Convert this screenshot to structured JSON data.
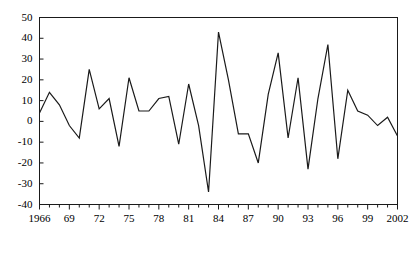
{
  "chart_data": {
    "type": "line",
    "title": "",
    "subtitle": "",
    "xlabel": "",
    "ylabel": "",
    "xlim": [
      1966,
      2002
    ],
    "ylim": [
      -40,
      50
    ],
    "ytick_values": [
      50,
      40,
      30,
      20,
      10,
      0,
      -10,
      -20,
      -30,
      -40
    ],
    "ytick_labels": [
      "50",
      "40",
      "30",
      "20",
      "10",
      "0",
      "-10",
      "-20",
      "-30",
      "-40"
    ],
    "xtick_values": [
      1966,
      1969,
      1972,
      1975,
      1978,
      1981,
      1984,
      1987,
      1990,
      1993,
      1996,
      1999,
      2002
    ],
    "xtick_labels": [
      "1966",
      "69",
      "72",
      "75",
      "78",
      "81",
      "84",
      "87",
      "90",
      "93",
      "96",
      "99",
      "2002"
    ],
    "x_minor_tick_interval": 1,
    "grid": false,
    "legend": false,
    "legend_position": "none",
    "series": [
      {
        "name": "series-1",
        "color": "#1a1a1a",
        "line_width": 1.2,
        "marker": "none",
        "x": [
          1966,
          1967,
          1968,
          1969,
          1970,
          1971,
          1972,
          1973,
          1974,
          1975,
          1976,
          1977,
          1978,
          1979,
          1980,
          1981,
          1982,
          1983,
          1984,
          1985,
          1986,
          1987,
          1988,
          1989,
          1990,
          1991,
          1992,
          1993,
          1994,
          1995,
          1996,
          1997,
          1998,
          1999,
          2000,
          2001,
          2002
        ],
        "values": [
          4,
          14,
          8,
          -2,
          -8,
          25,
          6,
          11,
          -12,
          21,
          5,
          5,
          11,
          12,
          -11,
          18,
          -2,
          -34,
          43,
          20,
          -6,
          -6,
          -20,
          13,
          33,
          -8,
          21,
          -23,
          11,
          37,
          -18,
          15,
          5,
          3,
          -2,
          2,
          -7
        ]
      }
    ]
  },
  "axes": {
    "frame_color": "#1a1a1a",
    "tick_color": "#1a1a1a",
    "background": "#ffffff"
  }
}
